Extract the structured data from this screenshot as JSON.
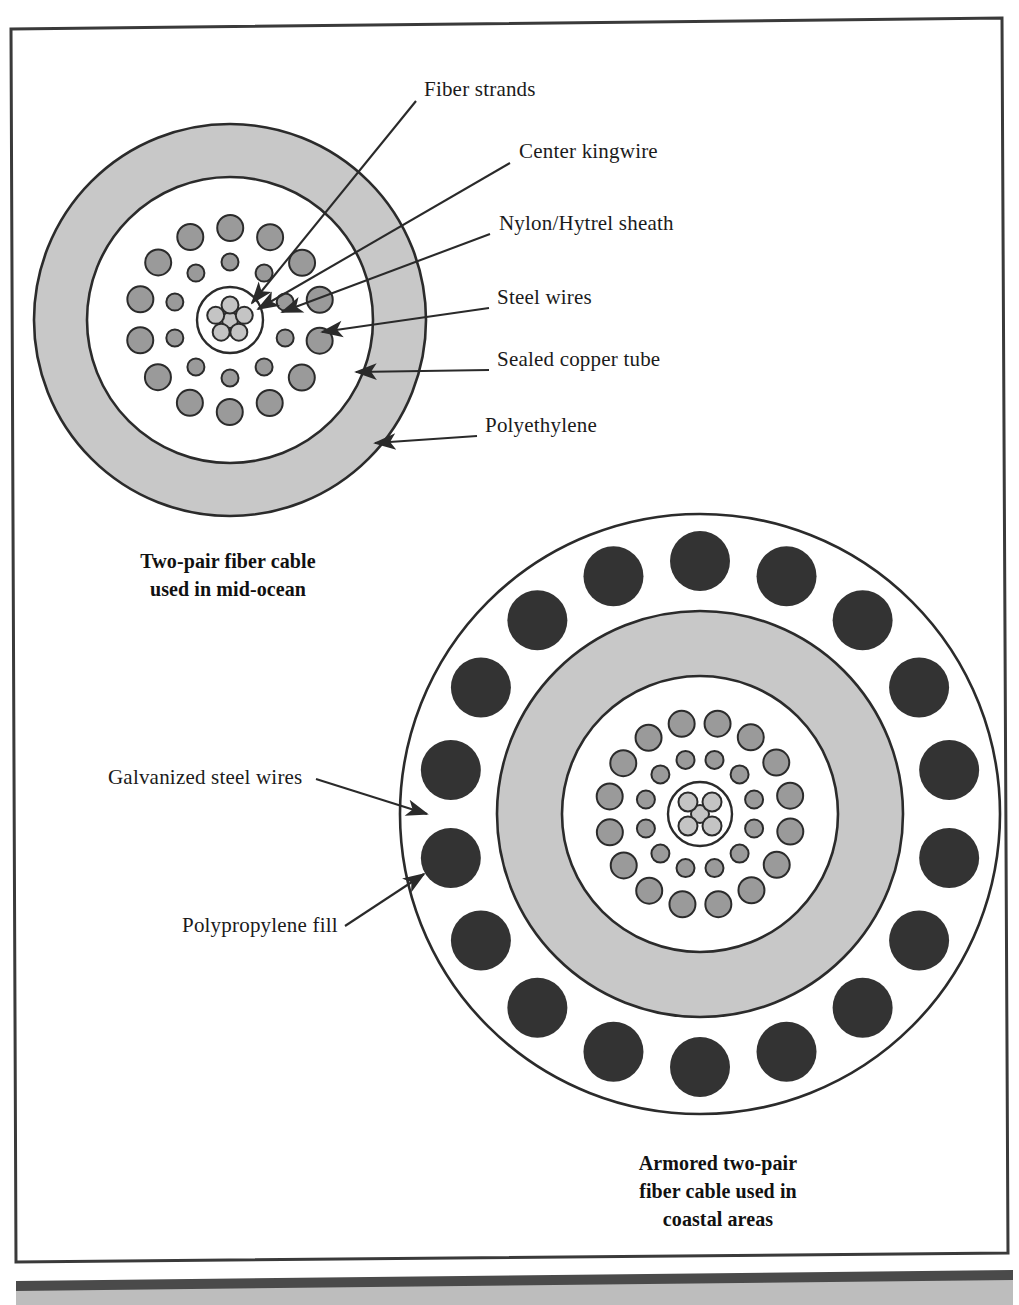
{
  "figure": {
    "background_color": "#ffffff",
    "ink_color": "#2a2a2a"
  },
  "colors": {
    "sheath_gray": "#c8c8c8",
    "strand_gray": "#9a9a9a",
    "strand_light": "#c4c4c4",
    "armor_dark": "#333333",
    "outline": "#2b2b2b",
    "white_fill": "#ffffff",
    "frame": "#3a3a3a",
    "footer_bar": "#4a4a4a",
    "footer_gray": "#bdbdbd"
  },
  "top_diagram": {
    "name": "two-pair-fiber-cable-mid-ocean",
    "caption_lines": [
      "Two-pair fiber cable",
      "used in mid-ocean"
    ],
    "geometry": {
      "cx": 230,
      "cy": 320,
      "outer_r": 196,
      "inner_r": 143,
      "center_r": 33
    },
    "labels": [
      {
        "id": "fiber-strands",
        "text": "Fiber strands",
        "x": 424,
        "y": 96,
        "tip_x": 247,
        "tip_y": 299,
        "elbow": null
      },
      {
        "id": "center-kingwire",
        "text": "Center kingwire",
        "x": 519,
        "y": 158,
        "tip_x": 252,
        "tip_y": 304,
        "elbow": null
      },
      {
        "id": "nylon-hytrel",
        "text": "Nylon/Hytrel sheath",
        "x": 499,
        "y": 230,
        "tip_x": 274,
        "tip_y": 310,
        "elbow": null
      },
      {
        "id": "steel-wires",
        "text": "Steel wires",
        "x": 497,
        "y": 304,
        "tip_x": 317,
        "tip_y": 331,
        "elbow": null
      },
      {
        "id": "sealed-copper-tube",
        "text": "Sealed copper tube",
        "x": 497,
        "y": 366,
        "tip_x": 351,
        "tip_y": 371,
        "elbow": null
      },
      {
        "id": "polyethylene",
        "text": "Polyethylene",
        "x": 485,
        "y": 432,
        "tip_x": 369,
        "tip_y": 441,
        "elbow": null
      }
    ],
    "strand_rings": [
      {
        "ring": "center-cluster",
        "count": 5,
        "radius": 15,
        "dot_r": 8.5,
        "phase": 54,
        "color": "strand_light",
        "has_hub": true,
        "hub_r": 8
      },
      {
        "ring": "inner-small",
        "count": 10,
        "radius": 58,
        "dot_r": 8.5,
        "phase": 18,
        "color": "strand_gray"
      },
      {
        "ring": "outer-large",
        "count": 14,
        "radius": 92,
        "dot_r": 13,
        "phase": 13,
        "color": "strand_gray"
      }
    ]
  },
  "bottom_diagram": {
    "name": "armored-two-pair-fiber-cable-coastal",
    "caption_lines": [
      "Armored two-pair",
      "fiber cable used in",
      "coastal areas"
    ],
    "geometry": {
      "cx": 700,
      "cy": 814,
      "outer_r": 300,
      "sheath_outer_r": 203,
      "sheath_inner_r": 138,
      "center_r": 32,
      "armor_ring_r": 253,
      "armor_dot_r": 30,
      "armor_count": 18
    },
    "labels": [
      {
        "id": "galvanized-steel-wires",
        "text": "Galvanized steel wires",
        "x": 108,
        "y": 784,
        "tip_x": 434,
        "tip_y": 814
      },
      {
        "id": "polypropylene-fill",
        "text": "Polypropylene fill",
        "x": 182,
        "y": 932,
        "tip_x": 430,
        "tip_y": 878
      }
    ],
    "strand_rings": [
      {
        "ring": "center-cluster",
        "count": 4,
        "radius": 17,
        "dot_r": 9.5,
        "phase": 45,
        "color": "strand_light",
        "has_hub": true,
        "hub_r": 9
      },
      {
        "ring": "inner-small",
        "count": 12,
        "radius": 56,
        "dot_r": 9,
        "phase": 15,
        "color": "strand_gray"
      },
      {
        "ring": "outer-large",
        "count": 16,
        "radius": 92,
        "dot_r": 13,
        "phase": 11,
        "color": "strand_gray"
      }
    ]
  },
  "footer": {
    "bar_visible": true,
    "gray_band_visible": true,
    "cut_text": ""
  }
}
